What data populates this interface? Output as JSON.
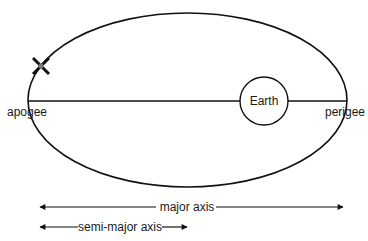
{
  "diagram": {
    "labels": {
      "apogee": "apogee",
      "perigee": "perigee",
      "earth": "Earth",
      "major_axis": "major axis",
      "semi_major_axis": "semi-major axis"
    },
    "colors": {
      "stroke": "#111111",
      "text": "#1a1a1a",
      "background": "#ffffff"
    },
    "icons": {
      "satellite": "satellite-x-icon"
    }
  }
}
